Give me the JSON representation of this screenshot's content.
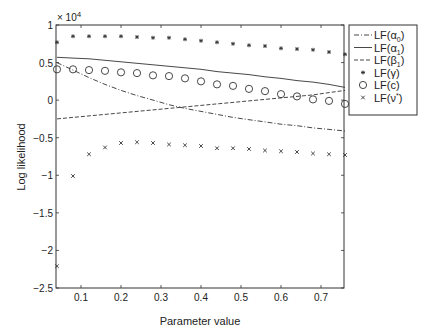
{
  "chart_data": {
    "type": "line",
    "title": "",
    "xlabel": "Parameter value",
    "ylabel": "Log likelihood",
    "y_multiplier_label": "× 10^4",
    "xlim": [
      0.0375,
      0.7575
    ],
    "ylim": [
      -2.5,
      1
    ],
    "xticks": [
      0.1,
      0.2,
      0.3,
      0.4,
      0.5,
      0.6,
      0.7
    ],
    "xtick_labels": [
      "0.1",
      "0.2",
      "0.3",
      "0.4",
      "0.5",
      "0.6",
      "0.7"
    ],
    "yticks": [
      -2.5,
      -2,
      -1.5,
      -1,
      -0.5,
      0,
      0.5,
      1
    ],
    "ytick_labels": [
      "-2.5",
      "-2",
      "-1.5",
      "-1",
      "-0.5",
      "0",
      "0.5",
      "1"
    ],
    "grid": false,
    "legend_position": "outside-right-top",
    "x": [
      0.04,
      0.08,
      0.12,
      0.16,
      0.2,
      0.24,
      0.28,
      0.32,
      0.36,
      0.4,
      0.44,
      0.48,
      0.52,
      0.56,
      0.6,
      0.64,
      0.68,
      0.72,
      0.76
    ],
    "series": [
      {
        "name": "LF(α0)",
        "label_base": "LF(α",
        "label_sub": "0",
        "label_end": ")",
        "style": "dash-dot-line",
        "values": [
          0.5,
          0.4,
          0.3,
          0.21,
          0.13,
          0.06,
          0.0,
          -0.06,
          -0.11,
          -0.15,
          -0.19,
          -0.23,
          -0.26,
          -0.29,
          -0.32,
          -0.34,
          -0.37,
          -0.39,
          -0.41
        ]
      },
      {
        "name": "LF(α1)",
        "label_base": "LF(α",
        "label_sub": "1",
        "label_end": ")",
        "style": "solid-line",
        "values": [
          0.57,
          0.56,
          0.55,
          0.53,
          0.51,
          0.49,
          0.47,
          0.45,
          0.43,
          0.41,
          0.38,
          0.36,
          0.34,
          0.31,
          0.29,
          0.26,
          0.24,
          0.21,
          0.17
        ]
      },
      {
        "name": "LF(β1)",
        "label_base": "LF(β",
        "label_sub": "1",
        "label_end": ")",
        "style": "dashed-line",
        "values": [
          -0.25,
          -0.23,
          -0.21,
          -0.19,
          -0.17,
          -0.15,
          -0.13,
          -0.11,
          -0.09,
          -0.07,
          -0.05,
          -0.03,
          -0.01,
          0.01,
          0.03,
          0.05,
          0.07,
          0.1,
          0.13
        ]
      },
      {
        "name": "LF(γ)",
        "label_base": "LF(γ",
        "label_sub": "",
        "label_end": ")",
        "style": "star-marker",
        "values": [
          0.77,
          0.85,
          0.85,
          0.85,
          0.85,
          0.84,
          0.83,
          0.83,
          0.81,
          0.79,
          0.77,
          0.75,
          0.73,
          0.72,
          0.69,
          0.68,
          0.67,
          0.64,
          0.61
        ]
      },
      {
        "name": "LF(c)",
        "label_base": "LF(c",
        "label_sub": "",
        "label_end": ")",
        "style": "circle-marker",
        "values": [
          0.41,
          0.41,
          0.4,
          0.39,
          0.37,
          0.36,
          0.33,
          0.32,
          0.29,
          0.25,
          0.21,
          0.19,
          0.15,
          0.12,
          0.08,
          0.05,
          0.01,
          -0.01,
          -0.05
        ]
      },
      {
        "name": "LF(ν*)",
        "label_base": "LF(ν",
        "label_sub": "",
        "label_sup": "*",
        "label_end": ")",
        "style": "x-marker",
        "values": [
          -2.21,
          -1.01,
          -0.72,
          -0.63,
          -0.57,
          -0.56,
          -0.57,
          -0.59,
          -0.6,
          -0.61,
          -0.64,
          -0.64,
          -0.65,
          -0.67,
          -0.68,
          -0.69,
          -0.71,
          -0.72,
          -0.73
        ]
      }
    ]
  },
  "colors": {
    "axis": "#333333",
    "series": "#333333",
    "background": "#ffffff"
  }
}
